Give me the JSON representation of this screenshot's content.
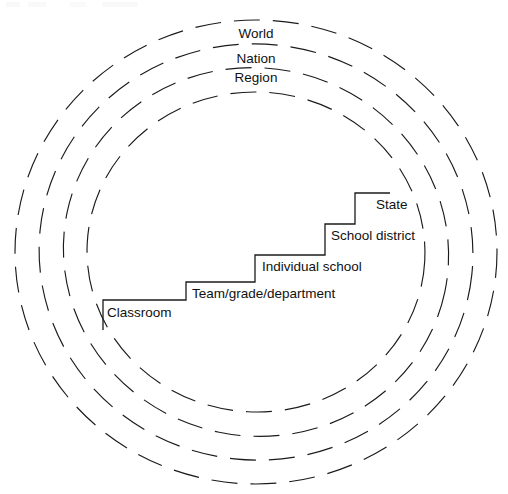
{
  "diagram": {
    "center": {
      "x": 256,
      "y": 252
    },
    "stroke_color": "#1b1b1b",
    "background_color": "#ffffff",
    "rings": [
      {
        "name": "world-ring",
        "label": "World",
        "rx": 241,
        "ry": 232,
        "label_x": 256,
        "label_y": 38
      },
      {
        "name": "nation-ring",
        "label": "Nation",
        "rx": 217,
        "ry": 208,
        "label_x": 256,
        "label_y": 63
      },
      {
        "name": "region-ring",
        "label": "Region",
        "rx": 193,
        "ry": 184,
        "label_x": 256,
        "label_y": 82
      },
      {
        "name": "inner-ring",
        "label": "",
        "rx": 169,
        "ry": 160,
        "label_x": 256,
        "label_y": 0
      }
    ],
    "ring_dash": "26 13",
    "staircase": {
      "name": "levels-staircase",
      "path": "M 103 330 L 103 300 L 186 300 L 186 282 L 255 282 L 255 255 L 325 255 L 325 224 L 355 224 L 355 193 L 390 193",
      "steps": [
        {
          "name": "step-classroom",
          "label": "Classroom",
          "label_x": 107,
          "label_y": 317
        },
        {
          "name": "step-team-grade-dept",
          "label": "Team/grade/department",
          "label_x": 192,
          "label_y": 298
        },
        {
          "name": "step-individual-school",
          "label": "Individual school",
          "label_x": 262,
          "label_y": 271
        },
        {
          "name": "step-school-district",
          "label": "School district",
          "label_x": 331,
          "label_y": 240
        },
        {
          "name": "step-state",
          "label": "State",
          "label_x": 376,
          "label_y": 209
        }
      ]
    }
  }
}
